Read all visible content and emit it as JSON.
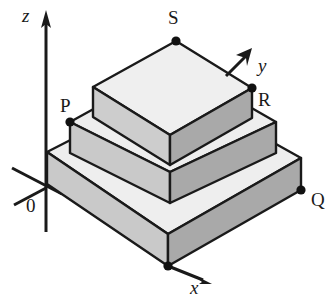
{
  "figure": {
    "kind": "three-dimensional-stepped-solid-diagram",
    "background_color": "#ffffff",
    "stroke_color": "#1a1a1a",
    "axes": [
      {
        "id": "z",
        "label": "z",
        "label_x": 22,
        "label_y": 6,
        "direction": "up"
      },
      {
        "id": "y",
        "label": "y",
        "label_x": 258,
        "label_y": 56,
        "direction": "up-right"
      },
      {
        "id": "x",
        "label": "x",
        "label_x": 190,
        "label_y": 278,
        "direction": "down-right"
      }
    ],
    "origin": {
      "label": "0",
      "x": 26,
      "y": 196
    },
    "vertex_labels": [
      {
        "id": "P",
        "label": "P",
        "label_x": 60,
        "label_y": 96,
        "dot_x": 70,
        "dot_y": 122
      },
      {
        "id": "Q",
        "label": "Q",
        "label_x": 311,
        "label_y": 190,
        "dot_x": 301,
        "dot_y": 190
      },
      {
        "id": "R",
        "label": "R",
        "label_x": 258,
        "label_y": 90,
        "dot_x": 252,
        "dot_y": 88
      },
      {
        "id": "S",
        "label": "S",
        "label_x": 168,
        "label_y": 8,
        "dot_x": 176,
        "dot_y": 41
      },
      {
        "id": "F",
        "label": "",
        "label_x": 0,
        "label_y": 0,
        "dot_x": 168,
        "dot_y": 266
      }
    ],
    "colors": {
      "top_face": "#eeeeee",
      "left_face": "#c9c9c9",
      "right_face": "#a9a9a9",
      "outline": "#1a1a1a"
    },
    "tiers": [
      {
        "name": "bottom-tier",
        "left_x": 47,
        "right_x": 301,
        "apex_y": 152,
        "height": 32
      },
      {
        "name": "middle-tier",
        "left_x": 70,
        "right_x": 276,
        "apex_y": 122,
        "height": 31
      },
      {
        "name": "top-tier",
        "left_x": 93,
        "right_x": 252,
        "apex_y": 88,
        "height": 30
      }
    ]
  }
}
